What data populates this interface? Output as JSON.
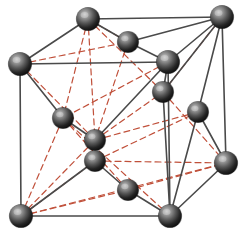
{
  "figure": {
    "background_color": "#ffffff",
    "width": 243,
    "height": 242
  },
  "style": {
    "atom_fill_dark": "#1a1a1a",
    "atom_fill_mid": "#4a4a4a",
    "atom_highlight": "#cfcfcf",
    "atom_edge": "#0d0d0d",
    "bond_solid_color": "#4a4a4a",
    "bond_solid_width": 1.6,
    "edge_solid_color": "#555555",
    "edge_solid_width": 1.8,
    "dashed_color": "#c0503a",
    "dashed_width": 1.2,
    "dash_pattern": "6 4",
    "atom_radius_corner": 11.5,
    "atom_radius_face": 10.5
  },
  "atoms": [
    {
      "id": "corner-top-back-left",
      "label": "corner atom (top back left)",
      "x": 88,
      "y": 19,
      "r": 11.5,
      "kind": "corner"
    },
    {
      "id": "corner-top-back-right",
      "label": "corner atom (top back right)",
      "x": 222,
      "y": 17,
      "r": 11.5,
      "kind": "corner"
    },
    {
      "id": "corner-top-front-left",
      "label": "corner atom (top front left)",
      "x": 20,
      "y": 64,
      "r": 11.5,
      "kind": "corner"
    },
    {
      "id": "corner-top-front-right",
      "label": "corner atom (top front right)",
      "x": 168,
      "y": 62,
      "r": 11.5,
      "kind": "corner"
    },
    {
      "id": "corner-bottom-back-right",
      "label": "corner atom (bottom back right)",
      "x": 226,
      "y": 163,
      "r": 11.5,
      "kind": "corner"
    },
    {
      "id": "corner-bottom-front-left",
      "label": "corner atom (bottom front left)",
      "x": 21,
      "y": 216,
      "r": 11.5,
      "kind": "corner"
    },
    {
      "id": "corner-bottom-front-right",
      "label": "corner atom (bottom front right)",
      "x": 170,
      "y": 216,
      "r": 11.5,
      "kind": "corner"
    },
    {
      "id": "face-top",
      "label": "face-center atom (top face)",
      "x": 128,
      "y": 42,
      "r": 10.5,
      "kind": "face"
    },
    {
      "id": "face-left",
      "label": "face-center atom (left face)",
      "x": 63,
      "y": 118,
      "r": 10.5,
      "kind": "face"
    },
    {
      "id": "face-right",
      "label": "face-center atom (right face)",
      "x": 198,
      "y": 112,
      "r": 10.5,
      "kind": "face"
    },
    {
      "id": "face-back",
      "label": "face-center atom (back face)",
      "x": 163,
      "y": 92,
      "r": 10.5,
      "kind": "face"
    },
    {
      "id": "face-front",
      "label": "face-center atom (front face)",
      "x": 128,
      "y": 190,
      "r": 10.5,
      "kind": "face"
    },
    {
      "id": "face-center-upper",
      "label": "interior atom (upper)",
      "x": 95,
      "y": 140,
      "r": 10.5,
      "kind": "face"
    },
    {
      "id": "face-center-lower",
      "label": "interior atom (lower)",
      "x": 95,
      "y": 161,
      "r": 10.5,
      "kind": "face"
    }
  ],
  "solid_bonds": [
    {
      "from": "corner-top-back-left",
      "to": "corner-top-back-right"
    },
    {
      "from": "corner-top-back-left",
      "to": "corner-top-front-left"
    },
    {
      "from": "corner-top-front-left",
      "to": "corner-top-front-right"
    },
    {
      "from": "corner-top-front-right",
      "to": "corner-top-back-right"
    },
    {
      "from": "corner-top-front-left",
      "to": "corner-bottom-front-left"
    },
    {
      "from": "corner-top-front-right",
      "to": "corner-bottom-front-right"
    },
    {
      "from": "corner-top-back-right",
      "to": "corner-bottom-back-right"
    },
    {
      "from": "corner-bottom-front-left",
      "to": "corner-bottom-front-right"
    },
    {
      "from": "corner-bottom-front-right",
      "to": "corner-bottom-back-right"
    },
    {
      "from": "corner-top-back-left",
      "to": "face-top"
    },
    {
      "from": "face-top",
      "to": "corner-top-front-right"
    },
    {
      "from": "face-top",
      "to": "corner-top-back-right"
    },
    {
      "from": "corner-top-front-left",
      "to": "face-left"
    },
    {
      "from": "face-left",
      "to": "face-center-upper"
    },
    {
      "from": "face-center-upper",
      "to": "corner-top-front-right"
    },
    {
      "from": "face-center-lower",
      "to": "corner-bottom-front-left"
    },
    {
      "from": "face-center-lower",
      "to": "face-front"
    },
    {
      "from": "face-front",
      "to": "corner-bottom-front-right"
    },
    {
      "from": "corner-top-front-right",
      "to": "face-back"
    },
    {
      "from": "face-back",
      "to": "corner-top-back-right"
    },
    {
      "from": "face-back",
      "to": "corner-bottom-front-right"
    },
    {
      "from": "corner-top-back-right",
      "to": "face-right"
    },
    {
      "from": "face-right",
      "to": "corner-bottom-back-right"
    },
    {
      "from": "face-right",
      "to": "corner-bottom-front-right"
    },
    {
      "from": "face-center-upper",
      "to": "face-center-lower"
    }
  ],
  "dashed_bonds": [
    {
      "from": "corner-top-back-left",
      "to": "face-left"
    },
    {
      "from": "corner-top-back-left",
      "to": "face-back"
    },
    {
      "from": "corner-top-back-left",
      "to": "face-center-upper"
    },
    {
      "from": "corner-top-back-left",
      "to": "face-top"
    },
    {
      "from": "corner-top-front-left",
      "to": "face-top"
    },
    {
      "from": "corner-top-front-left",
      "to": "face-center-upper"
    },
    {
      "from": "corner-top-front-right",
      "to": "face-left"
    },
    {
      "from": "corner-top-back-right",
      "to": "face-back"
    },
    {
      "from": "corner-bottom-front-left",
      "to": "face-left"
    },
    {
      "from": "corner-bottom-front-left",
      "to": "face-center-upper"
    },
    {
      "from": "corner-bottom-front-left",
      "to": "face-center-lower"
    },
    {
      "from": "corner-bottom-front-left",
      "to": "face-front"
    },
    {
      "from": "corner-bottom-front-left",
      "to": "corner-bottom-back-right"
    },
    {
      "from": "face-center-lower",
      "to": "corner-bottom-back-right"
    },
    {
      "from": "face-front",
      "to": "corner-bottom-back-right"
    },
    {
      "from": "face-center-upper",
      "to": "face-back"
    },
    {
      "from": "face-center-upper",
      "to": "face-right"
    },
    {
      "from": "face-center-lower",
      "to": "face-right"
    },
    {
      "from": "face-back",
      "to": "corner-bottom-back-right"
    },
    {
      "from": "face-top",
      "to": "face-center-upper"
    },
    {
      "from": "corner-bottom-front-right",
      "to": "face-left"
    },
    {
      "from": "face-left",
      "to": "face-front"
    }
  ]
}
